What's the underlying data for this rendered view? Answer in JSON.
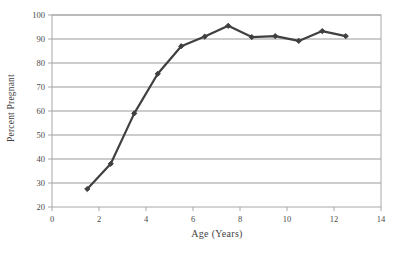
{
  "chart_data": {
    "type": "line",
    "title": "",
    "xlabel": "Age (Years)",
    "ylabel": "Percent Pregnant",
    "xlim": [
      0,
      14
    ],
    "ylim": [
      20,
      100
    ],
    "xticks": [
      0,
      2,
      4,
      6,
      8,
      10,
      12,
      14
    ],
    "yticks": [
      20,
      30,
      40,
      50,
      60,
      70,
      80,
      90,
      100
    ],
    "grid": "horizontal",
    "legend": "none",
    "marker": "diamond",
    "series_color": "#404040",
    "x": [
      1.5,
      2.5,
      3.5,
      4.5,
      5.5,
      6.5,
      7.5,
      8.5,
      9.5,
      10.5,
      11.5,
      12.5
    ],
    "values": [
      27.5,
      38.0,
      59.0,
      75.5,
      87.0,
      91.0,
      95.5,
      90.8,
      91.2,
      89.2,
      93.3,
      91.2
    ],
    "series": [
      {
        "name": "Percent Pregnant",
        "x": [
          1.5,
          2.5,
          3.5,
          4.5,
          5.5,
          6.5,
          7.5,
          8.5,
          9.5,
          10.5,
          11.5,
          12.5
        ],
        "values": [
          27.5,
          38.0,
          59.0,
          75.5,
          87.0,
          91.0,
          95.5,
          90.8,
          91.2,
          89.2,
          93.3,
          91.2
        ]
      }
    ]
  },
  "axes": {
    "x_tick_labels": [
      "0",
      "2",
      "4",
      "6",
      "8",
      "10",
      "12",
      "14"
    ],
    "y_tick_labels": [
      "20",
      "30",
      "40",
      "50",
      "60",
      "70",
      "80",
      "90",
      "100"
    ],
    "x_axis_title": "Age (Years)",
    "y_axis_title": "Percent Pregnant"
  },
  "colors": {
    "series": "#404040",
    "grid": "#9a9a9a",
    "frame": "#a8a8a8",
    "text": "#4a4a4a",
    "background": "#ffffff"
  }
}
